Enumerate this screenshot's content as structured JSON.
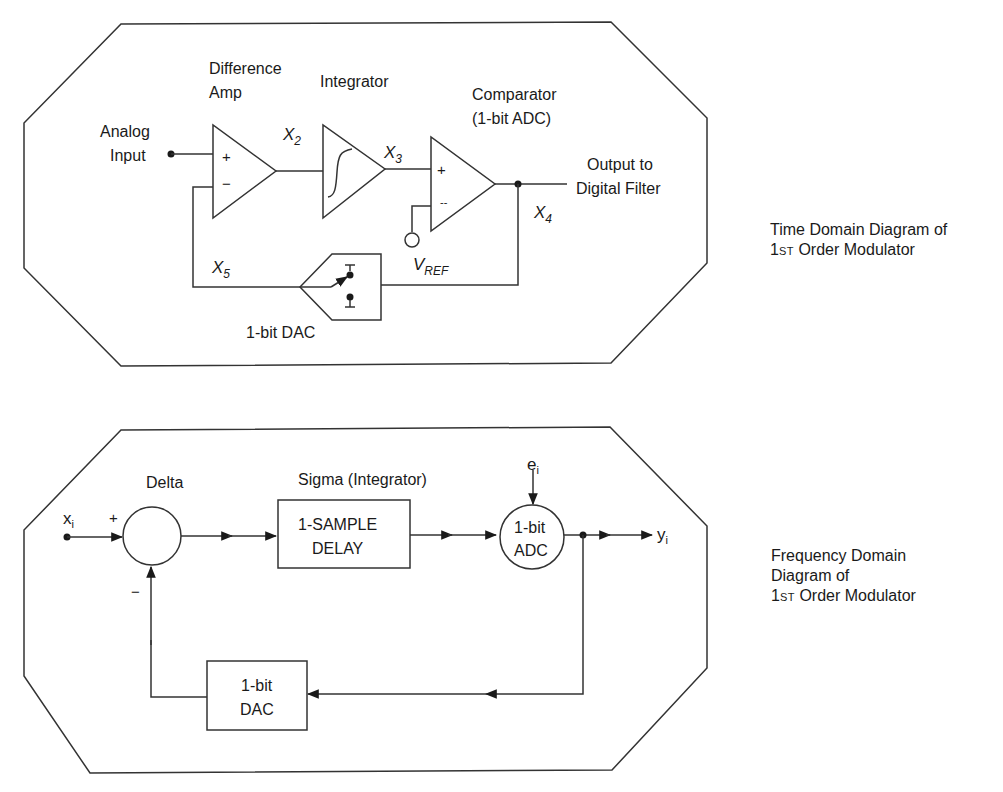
{
  "time_domain": {
    "caption_line1": "Time Domain Diagram of",
    "caption_line2_prefix": "1",
    "caption_line2_superscript": "ST",
    "caption_line2_suffix": " Order Modulator",
    "labels": {
      "diff_amp_line1": "Difference",
      "diff_amp_line2": "Amp",
      "integrator": "Integrator",
      "comparator_line1": "Comparator",
      "comparator_line2": "(1-bit ADC)",
      "analog_input_line1": "Analog",
      "analog_input_line2": "Input",
      "output_line1": "Output to",
      "output_line2": "Digital Filter",
      "dac": "1-bit DAC",
      "plus": "+",
      "minus": "−",
      "minus_dash": "--"
    },
    "nodes": {
      "x2": {
        "base": "X",
        "sub": "2"
      },
      "x3": {
        "base": "X",
        "sub": "3"
      },
      "x4": {
        "base": "X",
        "sub": "4"
      },
      "x5": {
        "base": "X",
        "sub": "5"
      },
      "vref": {
        "base": "V",
        "sub": "REF"
      }
    }
  },
  "frequency_domain": {
    "caption_line1": "Frequency Domain",
    "caption_line2": "Diagram of",
    "caption_line3_prefix": "1",
    "caption_line3_superscript": "ST",
    "caption_line3_suffix": " Order Modulator",
    "labels": {
      "delta": "Delta",
      "sigma": "Sigma (Integrator)",
      "delay_line1": "1-SAMPLE",
      "delay_line2": "DELAY",
      "adc_line1": "1-bit",
      "adc_line2": "ADC",
      "dac_line1": "1-bit",
      "dac_line2": "DAC",
      "plus": "+",
      "minus": "−"
    },
    "nodes": {
      "xi": {
        "base": "x",
        "sub": "i"
      },
      "ei": {
        "base": "e",
        "sub": "i"
      },
      "yi": {
        "base": "y",
        "sub": "i"
      }
    }
  }
}
